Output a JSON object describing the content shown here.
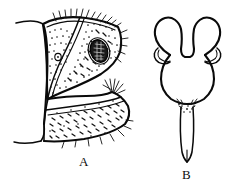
{
  "figure": {
    "kind": "scientific-line-drawing",
    "caption_style": "letter-labeled-panels",
    "background_color": "#ffffff",
    "ink_color": "#0a0a0a",
    "panels": [
      {
        "id": "A",
        "label": "A",
        "label_x": 79,
        "label_y": 155,
        "subject": "abdominal segment with stippled sclerites, marginal setae and dark sensory pit",
        "features": [
          "upper-sclerite-outline",
          "lower-lobe-outline",
          "body-margin-line",
          "dark-sensory-pit",
          "small-pale-pit",
          "marginal-setae-tuft",
          "stippling"
        ]
      },
      {
        "id": "B",
        "label": "B",
        "label_x": 182,
        "label_y": 168,
        "subject": "spermatheca with paired bulbous lobes, lateral appendages and long tapering stylet",
        "features": [
          "left-bulb",
          "right-bulb",
          "median-notch",
          "left-lateral-appendage",
          "right-lateral-appendage",
          "pear-shaped-body",
          "basal-granulation",
          "tapering-stylet"
        ]
      }
    ]
  }
}
